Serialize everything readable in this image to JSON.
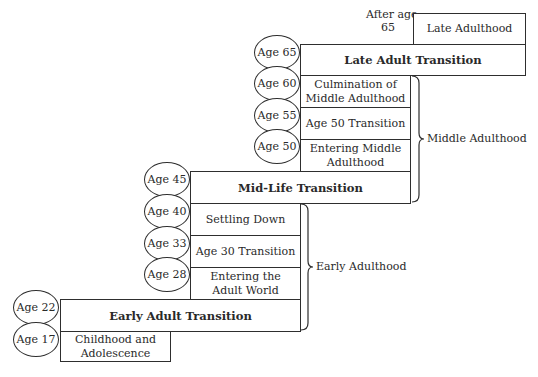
{
  "diagram": {
    "type": "staircase-life-stages",
    "periods": {
      "late_adulthood": {
        "age_label": "After age 65",
        "age_line1": "After age",
        "age_line2": "65",
        "label": "Late Adulthood"
      },
      "late_adult_transition": {
        "age": "Age 65",
        "label": "Late Adult Transition"
      },
      "culmination_middle": {
        "age": "Age 60",
        "line1": "Culmination of",
        "line2": "Middle Adulthood"
      },
      "age50_transition": {
        "age": "Age 55",
        "label": "Age 50 Transition"
      },
      "entering_middle": {
        "age": "Age 50",
        "line1": "Entering Middle",
        "line2": "Adulthood"
      },
      "midlife_transition": {
        "age": "Age 45",
        "label": "Mid-Life Transition"
      },
      "settling_down": {
        "age": "Age 40",
        "label": "Settling Down"
      },
      "age30_transition": {
        "age": "Age 33",
        "label": "Age 30 Transition"
      },
      "entering_adult_world": {
        "age": "Age 28",
        "line1": "Entering the",
        "line2": "Adult World"
      },
      "early_adult_transition": {
        "age": "Age 22",
        "label": "Early Adult Transition"
      },
      "childhood": {
        "age": "Age 17",
        "line1": "Childhood and",
        "line2": "Adolescence"
      }
    },
    "eras": {
      "middle": "Middle Adulthood",
      "early": "Early Adulthood"
    }
  }
}
